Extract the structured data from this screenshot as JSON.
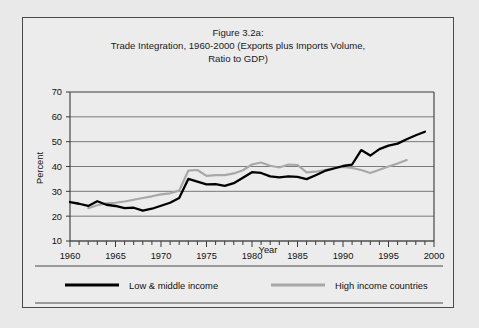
{
  "figure": {
    "title_lines": [
      "Figure 3.2a:",
      "Trade Integration, 1960-2000 (Exports plus Imports Volume,",
      "Ratio to GDP)"
    ],
    "title_line_1": "Figure 3.2a:",
    "title_line_2": "Trade Integration, 1960-2000 (Exports plus Imports Volume,",
    "title_line_3": "Ratio to GDP)"
  },
  "axes": {
    "ylabel": "Percent",
    "xlabel": "Year",
    "y_ticklabels": [
      "70",
      "60",
      "50",
      "40",
      "30",
      "20",
      "10"
    ],
    "x_ticklabels": [
      "1960",
      "1965",
      "1970",
      "1975",
      "1980",
      "1985",
      "1990",
      "1995",
      "2000"
    ]
  },
  "legend": {
    "items": [
      {
        "label": "Low & middle income",
        "color": "#000000"
      },
      {
        "label": "High income countries",
        "color": "#a8a8a8"
      }
    ],
    "item_0_label": "Low & middle income",
    "item_1_label": "High income countries"
  },
  "colors": {
    "low_middle_income": "#000000",
    "high_income": "#a8a8a8",
    "background": "#e9e9e9",
    "frame": "#4a4a4a",
    "gridline": "#6d6d6d"
  },
  "chart_data": {
    "type": "line",
    "title": "Figure 3.2a: Trade Integration, 1960-2000 (Exports plus Imports Volume, Ratio to GDP)",
    "xlabel": "Year",
    "ylabel": "Percent",
    "xlim": [
      1960,
      2000
    ],
    "ylim": [
      10,
      70
    ],
    "ytick_step": 10,
    "xtick_step": 1,
    "xtick_label_step": 5,
    "grid": "horizontal",
    "legend_position": "bottom",
    "series": [
      {
        "name": "Low & middle income",
        "color": "#000000",
        "x": [
          1960,
          1961,
          1962,
          1963,
          1964,
          1965,
          1966,
          1967,
          1968,
          1969,
          1970,
          1971,
          1972,
          1973,
          1974,
          1975,
          1976,
          1977,
          1978,
          1979,
          1980,
          1981,
          1982,
          1983,
          1984,
          1985,
          1986,
          1987,
          1988,
          1989,
          1990,
          1991,
          1992,
          1993,
          1994,
          1995,
          1996,
          1997,
          1998,
          1999
        ],
        "y": [
          25.7,
          25.0,
          24.1,
          26.0,
          24.6,
          24.1,
          23.2,
          23.4,
          22.2,
          23.0,
          24.2,
          25.4,
          27.3,
          35.0,
          33.9,
          32.8,
          32.9,
          32.2,
          33.3,
          35.5,
          37.7,
          37.4,
          36.0,
          35.6,
          36.0,
          35.8,
          34.9,
          36.5,
          38.2,
          39.2,
          40.2,
          40.8,
          46.6,
          44.4,
          47.0,
          48.4,
          49.2,
          51.0,
          52.6,
          54.0
        ]
      },
      {
        "name": "High income countries",
        "color": "#a8a8a8",
        "x": [
          1962,
          1963,
          1964,
          1965,
          1966,
          1967,
          1968,
          1969,
          1970,
          1971,
          1972,
          1973,
          1974,
          1975,
          1976,
          1977,
          1978,
          1979,
          1980,
          1981,
          1982,
          1983,
          1984,
          1985,
          1986,
          1987,
          1988,
          1989,
          1990,
          1991,
          1992,
          1993,
          1994,
          1995,
          1996,
          1997
        ],
        "y": [
          23.2,
          24.4,
          25.2,
          25.4,
          25.9,
          26.6,
          27.3,
          28.0,
          28.8,
          29.2,
          30.3,
          38.3,
          38.6,
          36.2,
          36.5,
          36.5,
          37.2,
          38.5,
          40.8,
          41.6,
          40.3,
          39.6,
          40.8,
          40.6,
          37.6,
          37.9,
          38.6,
          39.4,
          39.8,
          39.4,
          38.6,
          37.4,
          38.7,
          40.0,
          41.2,
          42.6
        ]
      }
    ]
  }
}
